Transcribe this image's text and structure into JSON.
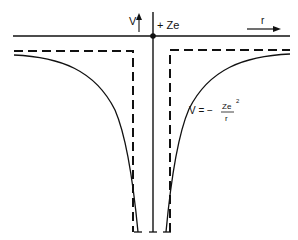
{
  "diagram": {
    "labels": {
      "v_axis": "V",
      "nucleus": "+ Ze",
      "r_axis": "r",
      "formula_prefix": "V = −",
      "formula_numerator": "Ze",
      "formula_exponent": "2",
      "formula_denominator": "r"
    },
    "elements": [
      {
        "id": "r-axis",
        "type": "solid line",
        "description": "horizontal r axis with arrow"
      },
      {
        "id": "v-axis",
        "type": "solid line",
        "description": "vertical axis through nucleus"
      },
      {
        "id": "nucleus",
        "type": "dot",
        "description": "point charge +Ze at origin"
      },
      {
        "id": "coulomb-curve",
        "type": "solid curve",
        "description": "V = -Ze^2/r, symmetric on both sides"
      },
      {
        "id": "square-well",
        "type": "dashed line",
        "description": "square-well approximation of potential"
      }
    ],
    "colors": {
      "ink": "#111111",
      "background": "#ffffff"
    }
  }
}
